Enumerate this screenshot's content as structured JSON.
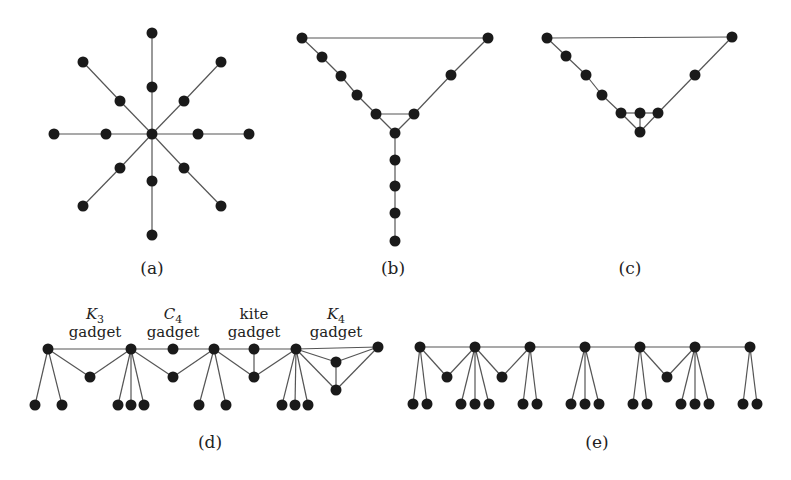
{
  "style": {
    "node_color": "#1a1a1a",
    "edge_color": "#555555",
    "background": "#ffffff",
    "node_radius": 5.5
  },
  "subfigures": [
    {
      "id": "a",
      "label": "(a)",
      "label_pos": [
        152,
        274
      ],
      "description": "Spider with 8 legs of length 2",
      "nodes": [
        [
          152,
          134
        ],
        [
          152,
          87
        ],
        [
          152,
          33
        ],
        [
          152,
          181
        ],
        [
          152,
          235
        ],
        [
          106,
          134
        ],
        [
          54,
          134
        ],
        [
          198,
          134
        ],
        [
          249,
          134
        ],
        [
          120,
          101
        ],
        [
          83,
          62
        ],
        [
          184,
          101
        ],
        [
          221,
          62
        ],
        [
          120,
          168
        ],
        [
          83,
          206
        ],
        [
          184,
          168
        ],
        [
          221,
          206
        ]
      ],
      "edges": [
        [
          0,
          1
        ],
        [
          1,
          2
        ],
        [
          0,
          3
        ],
        [
          3,
          4
        ],
        [
          0,
          5
        ],
        [
          5,
          6
        ],
        [
          0,
          7
        ],
        [
          7,
          8
        ],
        [
          0,
          9
        ],
        [
          9,
          10
        ],
        [
          0,
          11
        ],
        [
          11,
          12
        ],
        [
          0,
          13
        ],
        [
          13,
          14
        ],
        [
          0,
          15
        ],
        [
          15,
          16
        ]
      ]
    },
    {
      "id": "b",
      "label": "(b)",
      "label_pos": [
        393,
        274
      ],
      "description": "Cycle with triangle and pendant path",
      "nodes": [
        [
          302,
          38
        ],
        [
          322,
          57
        ],
        [
          341,
          76
        ],
        [
          357,
          95
        ],
        [
          376,
          114
        ],
        [
          414,
          114
        ],
        [
          395,
          133
        ],
        [
          451,
          75
        ],
        [
          488,
          38
        ],
        [
          395,
          160
        ],
        [
          395,
          186
        ],
        [
          395,
          213
        ],
        [
          395,
          241
        ]
      ],
      "edges": [
        [
          0,
          8
        ],
        [
          0,
          1
        ],
        [
          1,
          2
        ],
        [
          2,
          3
        ],
        [
          3,
          4
        ],
        [
          4,
          5
        ],
        [
          4,
          6
        ],
        [
          5,
          6
        ],
        [
          5,
          7
        ],
        [
          7,
          8
        ],
        [
          6,
          9
        ],
        [
          9,
          10
        ],
        [
          10,
          11
        ],
        [
          11,
          12
        ]
      ]
    },
    {
      "id": "c",
      "label": "(c)",
      "label_pos": [
        630,
        274
      ],
      "description": "Cycle with kite (diamond) gadget",
      "nodes": [
        [
          547,
          38
        ],
        [
          566,
          56
        ],
        [
          586,
          75
        ],
        [
          602,
          95
        ],
        [
          621,
          113
        ],
        [
          640,
          113
        ],
        [
          658,
          113
        ],
        [
          640,
          132
        ],
        [
          695,
          75
        ],
        [
          732,
          37
        ]
      ],
      "edges": [
        [
          0,
          9
        ],
        [
          0,
          1
        ],
        [
          1,
          2
        ],
        [
          2,
          3
        ],
        [
          3,
          4
        ],
        [
          4,
          5
        ],
        [
          5,
          6
        ],
        [
          4,
          7
        ],
        [
          5,
          7
        ],
        [
          6,
          7
        ],
        [
          6,
          8
        ],
        [
          8,
          9
        ]
      ]
    },
    {
      "id": "d",
      "label": "(d)",
      "label_pos": [
        210,
        448
      ],
      "description": "Path with K3, C4, kite and K4 gadgets and pendant leaves",
      "gadget_labels": [
        {
          "name": "K",
          "sub": "3",
          "italic": true,
          "line2": "gadget",
          "x": 95
        },
        {
          "name": "C",
          "sub": "4",
          "italic": true,
          "line2": "gadget",
          "x": 173
        },
        {
          "name": "kite",
          "sub": "",
          "italic": false,
          "line2": "gadget",
          "x": 254
        },
        {
          "name": "K",
          "sub": "4",
          "italic": true,
          "line2": "gadget",
          "x": 336
        }
      ],
      "gadget_label_y": [
        319,
        337
      ],
      "nodes": [
        [
          48,
          349
        ],
        [
          131,
          349
        ],
        [
          173,
          349
        ],
        [
          214,
          349
        ],
        [
          254,
          349
        ],
        [
          296,
          349
        ],
        [
          378,
          347
        ],
        [
          90,
          377
        ],
        [
          173,
          377
        ],
        [
          254,
          377
        ],
        [
          336,
          362
        ],
        [
          336,
          390
        ],
        [
          35,
          405
        ],
        [
          62,
          405
        ],
        [
          118,
          405
        ],
        [
          131,
          405
        ],
        [
          144,
          405
        ],
        [
          199,
          405
        ],
        [
          226,
          405
        ],
        [
          282,
          405
        ],
        [
          295,
          405
        ],
        [
          308,
          405
        ]
      ],
      "edges": [
        [
          0,
          1
        ],
        [
          1,
          2
        ],
        [
          2,
          3
        ],
        [
          3,
          4
        ],
        [
          4,
          5
        ],
        [
          5,
          6
        ],
        [
          0,
          7
        ],
        [
          7,
          1
        ],
        [
          1,
          8
        ],
        [
          8,
          3
        ],
        [
          4,
          9
        ],
        [
          3,
          9
        ],
        [
          9,
          5
        ],
        [
          5,
          10
        ],
        [
          5,
          11
        ],
        [
          10,
          11
        ],
        [
          10,
          6
        ],
        [
          11,
          6
        ],
        [
          0,
          12
        ],
        [
          0,
          13
        ],
        [
          1,
          14
        ],
        [
          1,
          15
        ],
        [
          1,
          16
        ],
        [
          3,
          17
        ],
        [
          3,
          18
        ],
        [
          5,
          19
        ],
        [
          5,
          20
        ],
        [
          5,
          21
        ]
      ]
    },
    {
      "id": "e",
      "label": "(e)",
      "label_pos": [
        597,
        448
      ],
      "description": "Path with triangle gadgets and pendant leaves",
      "nodes": [
        [
          420,
          347
        ],
        [
          475,
          347
        ],
        [
          530,
          347
        ],
        [
          585,
          347
        ],
        [
          640,
          347
        ],
        [
          695,
          347
        ],
        [
          750,
          347
        ],
        [
          447,
          377
        ],
        [
          502,
          377
        ],
        [
          667,
          377
        ],
        [
          413,
          404
        ],
        [
          427,
          404
        ],
        [
          461,
          404
        ],
        [
          475,
          404
        ],
        [
          489,
          404
        ],
        [
          523,
          404
        ],
        [
          537,
          404
        ],
        [
          571,
          404
        ],
        [
          585,
          404
        ],
        [
          599,
          404
        ],
        [
          633,
          404
        ],
        [
          647,
          404
        ],
        [
          681,
          404
        ],
        [
          695,
          404
        ],
        [
          709,
          404
        ],
        [
          743,
          404
        ],
        [
          757,
          404
        ]
      ],
      "edges": [
        [
          0,
          1
        ],
        [
          1,
          2
        ],
        [
          2,
          3
        ],
        [
          3,
          4
        ],
        [
          4,
          5
        ],
        [
          5,
          6
        ],
        [
          0,
          7
        ],
        [
          7,
          1
        ],
        [
          1,
          8
        ],
        [
          8,
          2
        ],
        [
          4,
          9
        ],
        [
          9,
          5
        ],
        [
          0,
          10
        ],
        [
          0,
          11
        ],
        [
          1,
          12
        ],
        [
          1,
          13
        ],
        [
          1,
          14
        ],
        [
          2,
          15
        ],
        [
          2,
          16
        ],
        [
          3,
          17
        ],
        [
          3,
          18
        ],
        [
          3,
          19
        ],
        [
          4,
          20
        ],
        [
          4,
          21
        ],
        [
          5,
          22
        ],
        [
          5,
          23
        ],
        [
          5,
          24
        ],
        [
          6,
          25
        ],
        [
          6,
          26
        ]
      ]
    }
  ]
}
